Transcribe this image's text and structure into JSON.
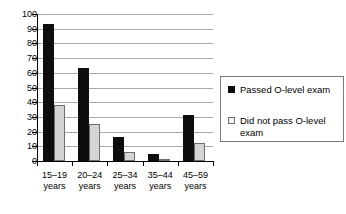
{
  "chart_data": {
    "type": "bar",
    "title": "",
    "subtitle": "",
    "xlabel": "",
    "ylabel": "",
    "ylim": [
      0,
      100
    ],
    "ytick_step": 10,
    "yticks": [
      100,
      90,
      80,
      70,
      60,
      50,
      40,
      30,
      20,
      10,
      0
    ],
    "grid": true,
    "grid_axis": "y",
    "legend_position": "right",
    "categories": [
      "15–19 years",
      "20–24 years",
      "25–34 years",
      "35–44 years",
      "45–59 years"
    ],
    "category_lines": [
      [
        "15–19",
        "years"
      ],
      [
        "20–24",
        "years"
      ],
      [
        "25–34",
        "years"
      ],
      [
        "35–44",
        "years"
      ],
      [
        "45–59",
        "years"
      ]
    ],
    "series": [
      {
        "name": "Passed O-level exam",
        "color": "#0d0d0d",
        "values": [
          93,
          63,
          16,
          5,
          31
        ]
      },
      {
        "name": "Did not pass O-level exam",
        "color": "#d4d4d4",
        "values": [
          38,
          25,
          6,
          1,
          12
        ]
      }
    ]
  },
  "legend": {
    "entries": [
      {
        "label": "Passed O-level exam"
      },
      {
        "label": "Did not pass O-level exam"
      }
    ]
  }
}
